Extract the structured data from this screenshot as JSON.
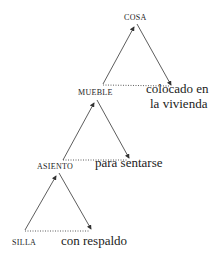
{
  "diagram": {
    "type": "semantic-hierarchy-triangles",
    "nodes": [
      {
        "id": "cosa",
        "label": "COSA"
      },
      {
        "id": "mueble",
        "label": "MUEBLE"
      },
      {
        "id": "asiento",
        "label": "ASIENTO"
      },
      {
        "id": "silla",
        "label": "SILLA"
      }
    ],
    "features": [
      {
        "of": "mueble",
        "line1": "colocado en",
        "line2": "la vivienda"
      },
      {
        "of": "asiento",
        "line1": "para sentarse"
      },
      {
        "of": "silla",
        "line1": "con respaldo"
      }
    ],
    "colors": {
      "line": "#333333",
      "text": "#222222",
      "background": "#ffffff"
    }
  }
}
